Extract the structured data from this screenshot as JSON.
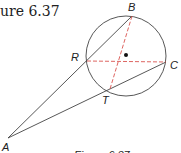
{
  "header": {
    "title": "ure 6.37"
  },
  "caption": "Figure 6.37",
  "diagram": {
    "circle": {
      "cx": 126,
      "cy": 56,
      "r": 40,
      "stroke": "#444444"
    },
    "center_dot": {
      "x": 126,
      "y": 55
    },
    "points": {
      "A": {
        "label": "A",
        "x": 8,
        "y": 138
      },
      "B": {
        "label": "B",
        "x": 132,
        "y": 16
      },
      "C": {
        "label": "C",
        "x": 166,
        "y": 62
      },
      "R": {
        "label": "R",
        "x": 87,
        "y": 61
      },
      "T": {
        "label": "T",
        "x": 110,
        "y": 89
      }
    },
    "solid_lines": [
      "AB",
      "AC"
    ],
    "dashed_lines": [
      "BT",
      "RC"
    ],
    "dashed_color": "#d9534f",
    "line_color": "#444444"
  }
}
